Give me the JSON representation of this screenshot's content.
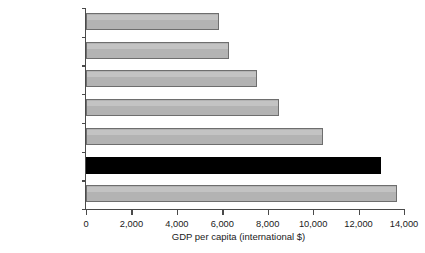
{
  "chart_data": {
    "type": "bar",
    "orientation": "horizontal",
    "title": "",
    "xlabel": "GDP per capita (international $)",
    "ylabel": "",
    "xlim": [
      0,
      14000
    ],
    "xticks": [
      "0",
      "2,000",
      "4,000",
      "6,000",
      "8,000",
      "10,000",
      "12,000",
      "14,000"
    ],
    "xtick_values": [
      0,
      2000,
      4000,
      6000,
      8000,
      10000,
      12000,
      14000
    ],
    "grid": false,
    "legend": null,
    "categories": [
      "Peru",
      "Venezuela, R.B. de",
      "Colombia",
      "Brazil",
      "Mexico",
      "Chile",
      "Argentina"
    ],
    "values": [
      5850,
      6280,
      7530,
      8500,
      10450,
      13000,
      13700
    ],
    "highlight_category": "Chile",
    "colors": {
      "bar_fill": "#b3b3b3",
      "bar_border": "#6e6e6e",
      "highlight_fill": "#000000",
      "axis": "#4a4a4a",
      "text": "#1a1a1a",
      "background": "#ffffff"
    }
  }
}
